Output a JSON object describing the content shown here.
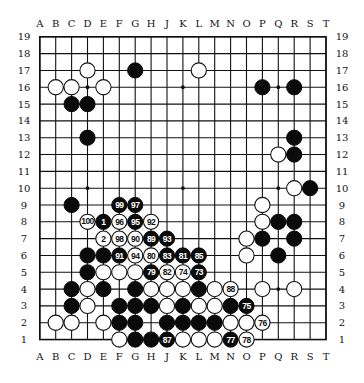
{
  "board": {
    "size": 19,
    "columns": [
      "A",
      "B",
      "C",
      "D",
      "E",
      "F",
      "G",
      "H",
      "J",
      "K",
      "L",
      "M",
      "N",
      "O",
      "P",
      "Q",
      "R",
      "S",
      "T"
    ],
    "rows": [
      "19",
      "18",
      "17",
      "16",
      "15",
      "14",
      "13",
      "12",
      "11",
      "10",
      "9",
      "8",
      "7",
      "6",
      "5",
      "4",
      "3",
      "2",
      "1"
    ],
    "star_points": [
      "D16",
      "K16",
      "Q16",
      "D10",
      "K10",
      "Q10",
      "D4",
      "K4",
      "Q4"
    ],
    "colors": {
      "background": "#ffffff",
      "line": "#111111",
      "black": "#0a0a0a",
      "white": "#ffffff"
    }
  },
  "stones": [
    {
      "pos": "D17",
      "color": "white"
    },
    {
      "pos": "G17",
      "color": "black"
    },
    {
      "pos": "L17",
      "color": "white"
    },
    {
      "pos": "B16",
      "color": "white"
    },
    {
      "pos": "C16",
      "color": "white"
    },
    {
      "pos": "E16",
      "color": "white"
    },
    {
      "pos": "P16",
      "color": "black"
    },
    {
      "pos": "R16",
      "color": "black"
    },
    {
      "pos": "C15",
      "color": "black"
    },
    {
      "pos": "D15",
      "color": "black"
    },
    {
      "pos": "D13",
      "color": "black"
    },
    {
      "pos": "R13",
      "color": "black"
    },
    {
      "pos": "Q12",
      "color": "white"
    },
    {
      "pos": "R12",
      "color": "black"
    },
    {
      "pos": "R10",
      "color": "white"
    },
    {
      "pos": "S10",
      "color": "black"
    },
    {
      "pos": "C9",
      "color": "black"
    },
    {
      "pos": "F9",
      "color": "black",
      "label": "99"
    },
    {
      "pos": "G9",
      "color": "black",
      "label": "97"
    },
    {
      "pos": "P9",
      "color": "white"
    },
    {
      "pos": "D8",
      "color": "white",
      "label": "100"
    },
    {
      "pos": "E8",
      "color": "black",
      "label": "1"
    },
    {
      "pos": "F8",
      "color": "white",
      "label": "96"
    },
    {
      "pos": "G8",
      "color": "black",
      "label": "95"
    },
    {
      "pos": "H8",
      "color": "white",
      "label": "92"
    },
    {
      "pos": "P8",
      "color": "white"
    },
    {
      "pos": "Q8",
      "color": "black"
    },
    {
      "pos": "R8",
      "color": "black"
    },
    {
      "pos": "E7",
      "color": "white",
      "label": "2"
    },
    {
      "pos": "F7",
      "color": "white",
      "label": "98"
    },
    {
      "pos": "G7",
      "color": "white",
      "label": "90"
    },
    {
      "pos": "H7",
      "color": "black",
      "label": "89"
    },
    {
      "pos": "J7",
      "color": "black",
      "label": "93"
    },
    {
      "pos": "O7",
      "color": "white"
    },
    {
      "pos": "P7",
      "color": "black"
    },
    {
      "pos": "R7",
      "color": "black"
    },
    {
      "pos": "D6",
      "color": "black"
    },
    {
      "pos": "E6",
      "color": "black"
    },
    {
      "pos": "F6",
      "color": "black",
      "label": "91"
    },
    {
      "pos": "G6",
      "color": "white",
      "label": "94"
    },
    {
      "pos": "H6",
      "color": "white",
      "label": "80"
    },
    {
      "pos": "J6",
      "color": "black",
      "label": "83"
    },
    {
      "pos": "K6",
      "color": "black",
      "label": "81"
    },
    {
      "pos": "L6",
      "color": "black",
      "label": "85"
    },
    {
      "pos": "O6",
      "color": "white"
    },
    {
      "pos": "Q6",
      "color": "black"
    },
    {
      "pos": "D5",
      "color": "black"
    },
    {
      "pos": "E5",
      "color": "white"
    },
    {
      "pos": "F5",
      "color": "white"
    },
    {
      "pos": "G5",
      "color": "white"
    },
    {
      "pos": "H5",
      "color": "black",
      "label": "79"
    },
    {
      "pos": "J5",
      "color": "white",
      "label": "82"
    },
    {
      "pos": "K5",
      "color": "white",
      "label": "74"
    },
    {
      "pos": "L5",
      "color": "black",
      "label": "73"
    },
    {
      "pos": "C4",
      "color": "black"
    },
    {
      "pos": "D4",
      "color": "white"
    },
    {
      "pos": "E4",
      "color": "black"
    },
    {
      "pos": "G4",
      "color": "black"
    },
    {
      "pos": "H4",
      "color": "white"
    },
    {
      "pos": "J4",
      "color": "white"
    },
    {
      "pos": "K4",
      "color": "white"
    },
    {
      "pos": "L4",
      "color": "black"
    },
    {
      "pos": "M4",
      "color": "white"
    },
    {
      "pos": "N4",
      "color": "white",
      "label": "88"
    },
    {
      "pos": "P4",
      "color": "white"
    },
    {
      "pos": "R4",
      "color": "white"
    },
    {
      "pos": "C3",
      "color": "black"
    },
    {
      "pos": "D3",
      "color": "white"
    },
    {
      "pos": "F3",
      "color": "black"
    },
    {
      "pos": "G3",
      "color": "black"
    },
    {
      "pos": "H3",
      "color": "black"
    },
    {
      "pos": "J3",
      "color": "white"
    },
    {
      "pos": "K3",
      "color": "black"
    },
    {
      "pos": "L3",
      "color": "white"
    },
    {
      "pos": "M3",
      "color": "white"
    },
    {
      "pos": "N3",
      "color": "black"
    },
    {
      "pos": "O3",
      "color": "black",
      "label": "75"
    },
    {
      "pos": "B2",
      "color": "white"
    },
    {
      "pos": "C2",
      "color": "white"
    },
    {
      "pos": "E2",
      "color": "white"
    },
    {
      "pos": "F2",
      "color": "black"
    },
    {
      "pos": "G2",
      "color": "black"
    },
    {
      "pos": "J2",
      "color": "black"
    },
    {
      "pos": "K2",
      "color": "black"
    },
    {
      "pos": "L2",
      "color": "black"
    },
    {
      "pos": "M2",
      "color": "black"
    },
    {
      "pos": "N2",
      "color": "white"
    },
    {
      "pos": "O2",
      "color": "white"
    },
    {
      "pos": "P2",
      "color": "white",
      "label": "76"
    },
    {
      "pos": "F1",
      "color": "white"
    },
    {
      "pos": "G1",
      "color": "black"
    },
    {
      "pos": "H1",
      "color": "black"
    },
    {
      "pos": "J1",
      "color": "black",
      "label": "87"
    },
    {
      "pos": "K1",
      "color": "white"
    },
    {
      "pos": "L1",
      "color": "white"
    },
    {
      "pos": "M1",
      "color": "white"
    },
    {
      "pos": "N1",
      "color": "black",
      "label": "77"
    },
    {
      "pos": "O1",
      "color": "white",
      "label": "78"
    }
  ]
}
